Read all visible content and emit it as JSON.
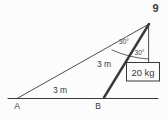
{
  "figure": {
    "problem_number": "9",
    "point_a_label": "A",
    "point_b_label": "B",
    "ground_length_label": "3 m",
    "rod_length_label": "3 m",
    "angle_top_label": "30°",
    "angle_lower_label": "30°",
    "mass_box_label": "20 kg",
    "colors": {
      "line": "#3a3a3a",
      "background": "#fcfcfc"
    }
  }
}
